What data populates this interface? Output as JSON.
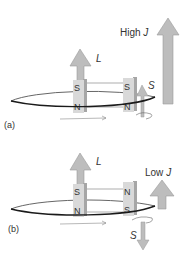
{
  "figure": {
    "panels": [
      {
        "id": "a",
        "label": "(a)",
        "orbital_vector_label": "L",
        "spin_vector_label": "S",
        "total_label": "High J",
        "magnet_left": {
          "top": "S",
          "bottom": "N"
        },
        "magnet_right": {
          "top": "S",
          "bottom": "N"
        },
        "spin_direction": "up"
      },
      {
        "id": "b",
        "label": "(b)",
        "orbital_vector_label": "L",
        "spin_vector_label": "S",
        "total_label": "Low J",
        "magnet_left": {
          "top": "S",
          "bottom": "N"
        },
        "magnet_right": {
          "top": "N",
          "bottom": "S"
        },
        "spin_direction": "down"
      }
    ],
    "colors": {
      "arrow_fill": "#b3b3b3",
      "magnet_front": "#d9d9d9",
      "magnet_side": "#a6a6a6",
      "orbit_line": "#1a1a1a",
      "text": "#333333"
    }
  }
}
